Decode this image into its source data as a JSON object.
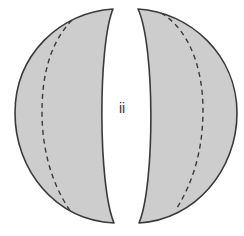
{
  "diagram": {
    "label": "ii",
    "colors": {
      "fill": "#cdcdcd",
      "stroke": "#3a3a3a",
      "dashed": "#3a3a3a",
      "background": "#ffffff",
      "text": "#333333"
    },
    "shapes": [
      {
        "name": "left-lobe",
        "type": "crescent"
      },
      {
        "name": "right-lobe",
        "type": "crescent"
      }
    ],
    "dashed_lines": [
      {
        "name": "left-dashed-curve"
      },
      {
        "name": "right-dashed-curve"
      }
    ]
  }
}
